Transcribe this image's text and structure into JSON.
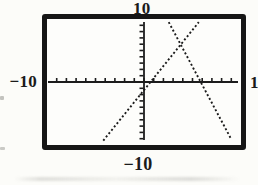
{
  "chart_data": {
    "type": "line",
    "title": "",
    "xlabel": "",
    "ylabel": "",
    "grid": false,
    "legend": false,
    "window": {
      "xmin": -10,
      "xmax": 10,
      "ymin": -10,
      "ymax": 10,
      "xscl": 1,
      "yscl": 1
    },
    "axis_edge_labels": {
      "top": "10",
      "left": "−10",
      "right": "1",
      "bottom": "−10"
    },
    "axes": {
      "x_axis": {
        "style": "solid",
        "ticks_every": 1,
        "tick_side": "above"
      },
      "y_axis": {
        "style": "solid",
        "ticks_every": 1,
        "tick_side": "left"
      }
    },
    "series": [
      {
        "name": "increasing-line",
        "style": "dotted",
        "slope_sign": "positive",
        "points": [
          [
            -4.2,
            -9.3
          ],
          [
            5.65,
            9.5
          ]
        ]
      },
      {
        "name": "decreasing-line",
        "style": "dotted",
        "slope_sign": "negative",
        "points": [
          [
            2.55,
            9.5
          ],
          [
            9.0,
            -9.1
          ]
        ]
      }
    ]
  },
  "colors": {
    "ink": "#1c1c1c",
    "frame": "#161616",
    "background": "#fcfcf9"
  }
}
